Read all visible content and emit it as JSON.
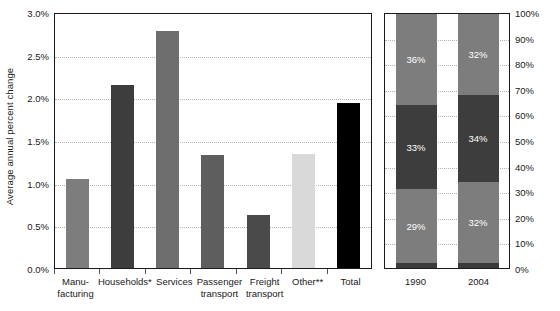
{
  "chart_data": [
    {
      "type": "bar",
      "title": "",
      "xlabel": "",
      "ylabel": "Average annual percent change",
      "categories": [
        "Manu-\nfacturing",
        "Households*",
        "Services",
        "Passenger\ntransport",
        "Freight\ntransport",
        "Other**",
        "Total"
      ],
      "category_lines": [
        [
          "Manu-",
          "facturing"
        ],
        [
          "Households*"
        ],
        [
          "Services"
        ],
        [
          "Passenger",
          "transport"
        ],
        [
          "Freight",
          "transport"
        ],
        [
          "Other**"
        ],
        [
          "Total"
        ]
      ],
      "values": [
        1.04,
        2.14,
        2.78,
        1.32,
        0.62,
        1.34,
        1.93
      ],
      "bar_colors": [
        "#7d7d7d",
        "#3d3d3d",
        "#6e6e6e",
        "#5e5e5e",
        "#4a4a4a",
        "#d9d9d9",
        "#000000"
      ],
      "ylim": [
        0,
        3.0
      ],
      "ytick_values": [
        0.0,
        0.5,
        1.0,
        1.5,
        2.0,
        2.5,
        3.0
      ],
      "ytick_labels": [
        "0.0%",
        "0.5%",
        "1.0%",
        "1.5%",
        "2.0%",
        "2.5%",
        "3.0%"
      ],
      "grid": true,
      "legend": "none"
    },
    {
      "type": "bar",
      "subtype": "stacked-percent",
      "title": "",
      "xlabel": "",
      "ylabel": "",
      "categories": [
        "1990",
        "2004"
      ],
      "series": [
        {
          "name": "bottom",
          "values": [
            29,
            32
          ],
          "color": "#7d7d7d",
          "labels": [
            "29%",
            "32%"
          ]
        },
        {
          "name": "middle",
          "values": [
            33,
            34
          ],
          "color": "#3d3d3d",
          "labels": [
            "33%",
            "34%"
          ]
        },
        {
          "name": "top",
          "values": [
            36,
            32
          ],
          "color": "#7d7d7d",
          "labels": [
            "36%",
            "32%"
          ]
        },
        {
          "name": "base-sliver",
          "values": [
            2,
            2
          ],
          "color": "#3a3a3a",
          "labels": [
            "",
            ""
          ]
        }
      ],
      "stack_order": [
        "base-sliver",
        "bottom",
        "middle",
        "top"
      ],
      "ylim": [
        0,
        100
      ],
      "ytick_values": [
        0,
        10,
        20,
        30,
        40,
        50,
        60,
        70,
        80,
        90,
        100
      ],
      "ytick_labels": [
        "0%",
        "10%",
        "20%",
        "30%",
        "40%",
        "50%",
        "60%",
        "70%",
        "80%",
        "90%",
        "100%"
      ],
      "ytick_position": "right",
      "grid": true,
      "legend": "none"
    }
  ],
  "colors": {
    "axis": "#1a1a1a",
    "grid": "#b4b4b4",
    "background": "#ffffff",
    "segment_label": "#ffffff"
  },
  "left": {
    "ylabel": "Average annual percent change",
    "yticks": [
      "0.0%",
      "0.5%",
      "1.0%",
      "1.5%",
      "2.0%",
      "2.5%",
      "3.0%"
    ],
    "bars": [
      {
        "label_line1": "Manu-",
        "label_line2": "facturing",
        "value": 1.04,
        "color": "#7d7d7d"
      },
      {
        "label_line1": "Households*",
        "label_line2": "",
        "value": 2.14,
        "color": "#3d3d3d"
      },
      {
        "label_line1": "Services",
        "label_line2": "",
        "value": 2.78,
        "color": "#6e6e6e"
      },
      {
        "label_line1": "Passenger",
        "label_line2": "transport",
        "value": 1.32,
        "color": "#5e5e5e"
      },
      {
        "label_line1": "Freight",
        "label_line2": "transport",
        "value": 0.62,
        "color": "#4a4a4a"
      },
      {
        "label_line1": "Other**",
        "label_line2": "",
        "value": 1.34,
        "color": "#d9d9d9"
      },
      {
        "label_line1": "Total",
        "label_line2": "",
        "value": 1.93,
        "color": "#000000"
      }
    ]
  },
  "right": {
    "yticks": [
      "0%",
      "10%",
      "20%",
      "30%",
      "40%",
      "50%",
      "60%",
      "70%",
      "80%",
      "90%",
      "100%"
    ],
    "stacks": [
      {
        "label": "1990",
        "segments": [
          {
            "name": "top",
            "pct": 36,
            "text": "36%",
            "color": "#7d7d7d"
          },
          {
            "name": "middle",
            "pct": 33,
            "text": "33%",
            "color": "#3d3d3d"
          },
          {
            "name": "bottom",
            "pct": 29,
            "text": "29%",
            "color": "#7d7d7d"
          },
          {
            "name": "base",
            "pct": 2,
            "text": "",
            "color": "#3a3a3a"
          }
        ]
      },
      {
        "label": "2004",
        "segments": [
          {
            "name": "top",
            "pct": 32,
            "text": "32%",
            "color": "#7d7d7d"
          },
          {
            "name": "middle",
            "pct": 34,
            "text": "34%",
            "color": "#3d3d3d"
          },
          {
            "name": "bottom",
            "pct": 32,
            "text": "32%",
            "color": "#7d7d7d"
          },
          {
            "name": "base",
            "pct": 2,
            "text": "",
            "color": "#3a3a3a"
          }
        ]
      }
    ]
  }
}
